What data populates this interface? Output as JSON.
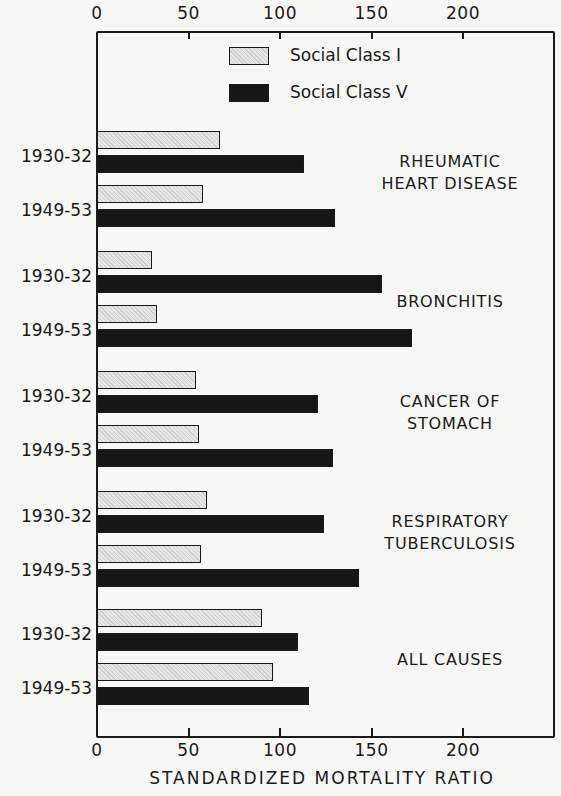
{
  "chart_data": {
    "type": "bar",
    "orientation": "horizontal",
    "title": "",
    "xlabel": "STANDARDIZED MORTALITY RATIO",
    "ylabel": "",
    "xlim": [
      0,
      250
    ],
    "xticks": [
      0,
      50,
      100,
      150,
      200
    ],
    "grid": false,
    "legend_position": "top-center inside",
    "categories": [
      {
        "name": "RHEUMATIC HEART DISEASE",
        "lines": [
          "RHEUMATIC",
          "HEART DISEASE"
        ]
      },
      {
        "name": "BRONCHITIS",
        "lines": [
          "BRONCHITIS"
        ]
      },
      {
        "name": "CANCER OF STOMACH",
        "lines": [
          "CANCER OF",
          "STOMACH"
        ]
      },
      {
        "name": "RESPIRATORY TUBERCULOSIS",
        "lines": [
          "RESPIRATORY",
          "TUBERCULOSIS"
        ]
      },
      {
        "name": "ALL CAUSES",
        "lines": [
          "ALL CAUSES"
        ]
      }
    ],
    "periods": [
      "1930-32",
      "1949-53"
    ],
    "series": [
      {
        "name": "Social Class I",
        "color": "#d9d9d9",
        "pattern": "stipple",
        "values": [
          [
            67,
            58
          ],
          [
            30,
            33
          ],
          [
            54,
            56
          ],
          [
            60,
            57
          ],
          [
            90,
            96
          ]
        ]
      },
      {
        "name": "Social Class V",
        "color": "#161616",
        "pattern": "solid",
        "values": [
          [
            113,
            130
          ],
          [
            156,
            172
          ],
          [
            121,
            129
          ],
          [
            124,
            143
          ],
          [
            110,
            116
          ]
        ]
      }
    ]
  },
  "axis": {
    "top_ticks": [
      "0",
      "50",
      "100",
      "150",
      "200"
    ],
    "bottom_ticks": [
      "0",
      "50",
      "100",
      "150",
      "200"
    ]
  },
  "legend": {
    "items": [
      {
        "label": "Social Class I"
      },
      {
        "label": "Social Class V"
      }
    ]
  }
}
